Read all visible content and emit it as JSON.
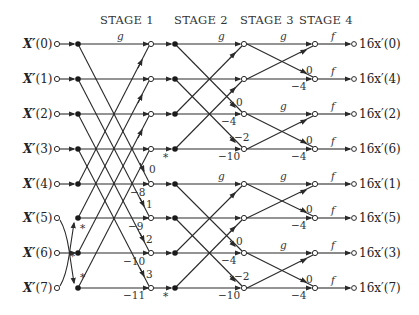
{
  "diagram": {
    "type": "FFT signal flow graph (8-point)",
    "stages": [
      "STAGE 1",
      "STAGE 2",
      "STAGE 3",
      "STAGE 4"
    ],
    "inputs": [
      "X′(0)",
      "X′(1)",
      "X′(2)",
      "X′(3)",
      "X′(4)",
      "X′(5)",
      "X′(6)",
      "X′(7)"
    ],
    "outputs": [
      "16x′(0)",
      "16x′(4)",
      "16x′(2)",
      "16x′(6)",
      "16x′(1)",
      "16x′(5)",
      "16x′(3)",
      "16x′(7)"
    ],
    "branch_labels": {
      "g": "g",
      "f": "f",
      "conj": "*"
    },
    "stage1_twiddles_down": [
      "0",
      "1",
      "2",
      "3"
    ],
    "stage1_twiddles_horiz": [
      "−8",
      "−9",
      "−10",
      "−11"
    ],
    "stage2_twiddles_down": [
      "0",
      "−2",
      "0",
      "−2"
    ],
    "stage2_twiddles_horiz": [
      "−4",
      "−10",
      "−4",
      "−10"
    ],
    "stage3_twiddles_down": [
      "0",
      "0",
      "0",
      "0"
    ],
    "stage3_twiddles_horiz": [
      "−4",
      "−4",
      "−4",
      "−4"
    ],
    "colors": {
      "line": "#2a2a2a",
      "background": "#ffffff"
    }
  }
}
